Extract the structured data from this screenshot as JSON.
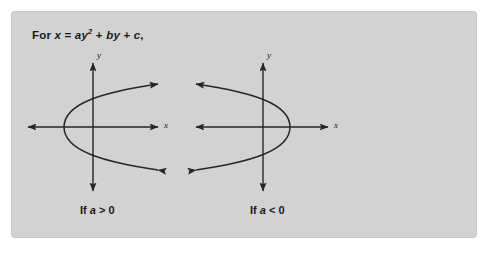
{
  "figure": {
    "background_color": "#ffffff",
    "panel_color": "#d2d2d2",
    "ink_color": "#262626"
  },
  "formula": {
    "prefix": "For ",
    "lhs": "x",
    "equals": " = ",
    "coef_a": "a",
    "var_y": "y",
    "exponent": "2",
    "plus1": " + ",
    "coef_b": "b",
    "var_y2": "y",
    "plus2": " + ",
    "coef_c": "c",
    "comma": ","
  },
  "graphs": [
    {
      "id": "left",
      "caption_prefix": "If ",
      "caption_var": "a",
      "caption_rel": " > 0",
      "x_axis_label": "x",
      "y_axis_label": "y",
      "opens": "right",
      "vertex": [
        64,
        127
      ],
      "arrow_tips": [
        [
          162,
          86
        ],
        [
          162,
          168
        ]
      ],
      "y_axis_x": 93,
      "x_axis_y": 127,
      "x_axis_span": [
        22,
        158
      ],
      "y_axis_span": [
        57,
        190
      ]
    },
    {
      "id": "right",
      "caption_prefix": "If ",
      "caption_var": "a",
      "caption_rel": " < 0",
      "x_axis_label": "x",
      "y_axis_label": "y",
      "opens": "left",
      "vertex": [
        290,
        127
      ],
      "arrow_tips": [
        [
          188,
          86
        ],
        [
          188,
          168
        ]
      ],
      "y_axis_x": 263,
      "x_axis_y": 127,
      "x_axis_span": [
        190,
        328
      ],
      "y_axis_span": [
        57,
        190
      ]
    }
  ]
}
